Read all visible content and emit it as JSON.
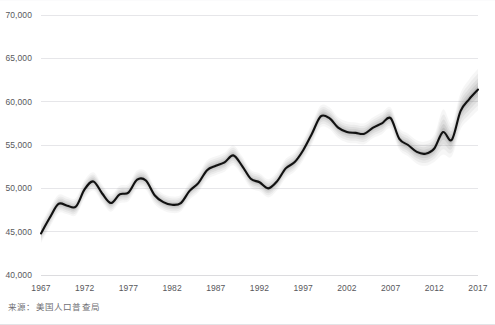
{
  "source_note": "来源：美国人口普查局",
  "colors": {
    "line": "#111111",
    "grid": "#e0e0e3",
    "tick_text": "#58585c",
    "note_text": "#6f6f73",
    "background": "#ffffff",
    "band": "#808080"
  },
  "chart_data": {
    "type": "line",
    "title": "",
    "subtitle": "",
    "xlabel": "",
    "ylabel": "",
    "grid": true,
    "legend": "none",
    "xlim": [
      1967,
      2017
    ],
    "ylim": [
      40000,
      70000
    ],
    "ytick_values": [
      40000,
      45000,
      50000,
      55000,
      60000,
      65000,
      70000
    ],
    "ytick_labels": [
      "40,000",
      "45,000",
      "50,000",
      "55,000",
      "60,000",
      "65,000",
      "70,000"
    ],
    "xtick_values": [
      1967,
      1972,
      1977,
      1982,
      1987,
      1992,
      1997,
      2002,
      2007,
      2012,
      2017
    ],
    "xtick_labels": [
      "1967",
      "1972",
      "1977",
      "1982",
      "1987",
      "1992",
      "1997",
      "2002",
      "2007",
      "2012",
      "2017"
    ],
    "x": [
      1967,
      1968,
      1969,
      1970,
      1971,
      1972,
      1973,
      1974,
      1975,
      1976,
      1977,
      1978,
      1979,
      1980,
      1981,
      1982,
      1983,
      1984,
      1985,
      1986,
      1987,
      1988,
      1989,
      1990,
      1991,
      1992,
      1993,
      1994,
      1995,
      1996,
      1997,
      1998,
      1999,
      2000,
      2001,
      2002,
      2003,
      2004,
      2005,
      2006,
      2007,
      2008,
      2009,
      2010,
      2011,
      2012,
      2013,
      2014,
      2015,
      2016,
      2017
    ],
    "series": [
      {
        "name": "实际中位数家庭收入",
        "values": [
          44800,
          46600,
          48200,
          48000,
          47900,
          49900,
          50800,
          49400,
          48300,
          49300,
          49500,
          51000,
          50900,
          49200,
          48400,
          48100,
          48300,
          49700,
          50600,
          52100,
          52600,
          53000,
          53800,
          52600,
          51100,
          50700,
          50000,
          50800,
          52300,
          53000,
          54400,
          56300,
          58300,
          58100,
          57000,
          56500,
          56400,
          56300,
          57000,
          57500,
          58100,
          55700,
          55000,
          54200,
          54000,
          54600,
          56500,
          55600,
          58900,
          60300,
          61400
        ]
      }
    ],
    "uncertainty_bands": [
      {
        "level": "band-widest",
        "opacity": 0.07,
        "halfwidth": [
          1100,
          1100,
          1050,
          1000,
          1000,
          1050,
          1050,
          1000,
          1000,
          1000,
          1000,
          1050,
          1050,
          1000,
          950,
          950,
          950,
          1000,
          1050,
          1100,
          1100,
          1100,
          1150,
          1100,
          1050,
          1050,
          1050,
          1050,
          1100,
          1100,
          1150,
          1200,
          1250,
          1250,
          1200,
          1200,
          1200,
          1200,
          1200,
          1250,
          1250,
          1250,
          1300,
          1350,
          1400,
          1550,
          2600,
          1900,
          2100,
          2300,
          2400
        ]
      },
      {
        "level": "band-wide",
        "opacity": 0.09,
        "halfwidth": [
          850,
          850,
          800,
          780,
          780,
          800,
          800,
          780,
          760,
          760,
          760,
          800,
          800,
          760,
          730,
          730,
          730,
          760,
          800,
          840,
          840,
          840,
          880,
          840,
          800,
          800,
          800,
          800,
          840,
          840,
          880,
          920,
          960,
          960,
          920,
          920,
          920,
          920,
          920,
          960,
          960,
          960,
          1000,
          1040,
          1080,
          1190,
          2000,
          1460,
          1610,
          1770,
          1840
        ]
      },
      {
        "level": "band-mid",
        "opacity": 0.12,
        "halfwidth": [
          600,
          600,
          570,
          550,
          550,
          570,
          570,
          550,
          540,
          540,
          540,
          570,
          570,
          540,
          520,
          520,
          520,
          540,
          570,
          600,
          600,
          600,
          620,
          600,
          570,
          570,
          570,
          570,
          600,
          600,
          620,
          650,
          680,
          680,
          650,
          650,
          650,
          650,
          650,
          680,
          680,
          680,
          710,
          740,
          770,
          850,
          1420,
          1040,
          1150,
          1260,
          1310
        ]
      },
      {
        "level": "band-narrow",
        "opacity": 0.16,
        "halfwidth": [
          380,
          380,
          360,
          350,
          350,
          360,
          360,
          350,
          340,
          340,
          340,
          360,
          360,
          340,
          330,
          330,
          330,
          340,
          360,
          380,
          380,
          380,
          390,
          380,
          360,
          360,
          360,
          360,
          380,
          380,
          390,
          410,
          430,
          430,
          410,
          410,
          410,
          410,
          410,
          430,
          430,
          430,
          450,
          470,
          490,
          540,
          900,
          660,
          730,
          800,
          830
        ]
      },
      {
        "level": "band-tightest",
        "opacity": 0.22,
        "halfwidth": [
          200,
          200,
          190,
          185,
          185,
          190,
          190,
          185,
          180,
          180,
          180,
          190,
          190,
          180,
          175,
          175,
          175,
          180,
          190,
          200,
          200,
          200,
          205,
          200,
          190,
          190,
          190,
          190,
          200,
          200,
          205,
          215,
          225,
          225,
          215,
          215,
          215,
          215,
          215,
          225,
          225,
          225,
          235,
          245,
          255,
          280,
          470,
          345,
          380,
          415,
          435
        ]
      }
    ]
  }
}
